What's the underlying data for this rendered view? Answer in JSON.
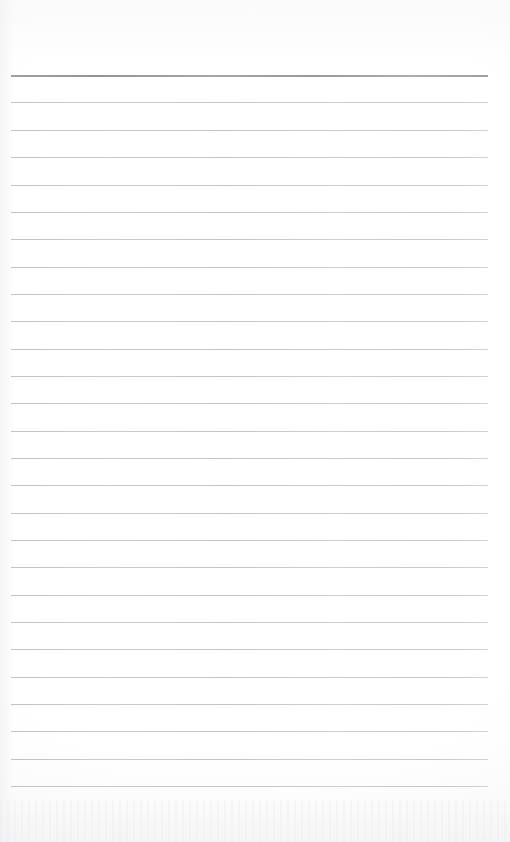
{
  "document": {
    "type": "scanned-ruled-notebook-page",
    "title": "Blank Ruled Notebook Page",
    "orientation": "portrait",
    "page_width_px": 510,
    "page_height_px": 842,
    "paper_color": "#ffffff",
    "text_content": "",
    "handwriting_present": "no",
    "printed_text_present": "no"
  },
  "ruling": {
    "line_count": 27,
    "first_line_y": 75,
    "line_spacing_px": 27.35,
    "left_margin_x": 11,
    "right_margin_x": 488,
    "line_length_px": 477,
    "header_rule": {
      "index": 0,
      "y": 75,
      "thickness_px": 2,
      "color": "#939397",
      "label": "header-rule"
    },
    "body_rule": {
      "thickness_px": 1,
      "color": "#c4c4c8",
      "label": "body-rule"
    },
    "lines": [
      {
        "index": 0,
        "y": 75,
        "kind": "header"
      },
      {
        "index": 1,
        "y": 102,
        "kind": "body"
      },
      {
        "index": 2,
        "y": 130,
        "kind": "body"
      },
      {
        "index": 3,
        "y": 157,
        "kind": "body"
      },
      {
        "index": 4,
        "y": 185,
        "kind": "body"
      },
      {
        "index": 5,
        "y": 212,
        "kind": "body"
      },
      {
        "index": 6,
        "y": 239,
        "kind": "body"
      },
      {
        "index": 7,
        "y": 267,
        "kind": "body"
      },
      {
        "index": 8,
        "y": 294,
        "kind": "body"
      },
      {
        "index": 9,
        "y": 321,
        "kind": "body"
      },
      {
        "index": 10,
        "y": 349,
        "kind": "body"
      },
      {
        "index": 11,
        "y": 376,
        "kind": "body"
      },
      {
        "index": 12,
        "y": 403,
        "kind": "body"
      },
      {
        "index": 13,
        "y": 431,
        "kind": "body"
      },
      {
        "index": 14,
        "y": 458,
        "kind": "body"
      },
      {
        "index": 15,
        "y": 485,
        "kind": "body"
      },
      {
        "index": 16,
        "y": 513,
        "kind": "body"
      },
      {
        "index": 17,
        "y": 540,
        "kind": "body"
      },
      {
        "index": 18,
        "y": 567,
        "kind": "body"
      },
      {
        "index": 19,
        "y": 595,
        "kind": "body"
      },
      {
        "index": 20,
        "y": 622,
        "kind": "body"
      },
      {
        "index": 21,
        "y": 649,
        "kind": "body"
      },
      {
        "index": 22,
        "y": 677,
        "kind": "body"
      },
      {
        "index": 23,
        "y": 704,
        "kind": "body"
      },
      {
        "index": 24,
        "y": 731,
        "kind": "body"
      },
      {
        "index": 25,
        "y": 759,
        "kind": "body"
      },
      {
        "index": 26,
        "y": 786,
        "kind": "body"
      }
    ]
  },
  "margins": {
    "top_blank_px": 75,
    "bottom_blank_px": 56,
    "left_blank_px": 11,
    "right_blank_px": 22
  },
  "scan_artifacts": {
    "bottom_noise_band": "faint horizontal scanner noise along the bottom edge",
    "edge_vignette": "subtle light-grey vignette at the page borders"
  }
}
